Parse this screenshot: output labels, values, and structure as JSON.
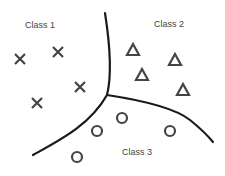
{
  "diagram": {
    "labels": [
      {
        "text": "Class 1",
        "x": 25,
        "y": 20
      },
      {
        "text": "Class 2",
        "x": 154,
        "y": 19
      },
      {
        "text": "Class 3",
        "x": 122,
        "y": 147
      }
    ],
    "classes": [
      {
        "name": "Class 1",
        "marker": "cross",
        "points": [
          [
            20,
            59
          ],
          [
            58,
            52
          ],
          [
            80,
            87
          ],
          [
            37,
            103
          ]
        ]
      },
      {
        "name": "Class 2",
        "marker": "triangle",
        "points": [
          [
            133,
            50
          ],
          [
            175,
            60
          ],
          [
            142,
            75
          ],
          [
            183,
            90
          ]
        ]
      },
      {
        "name": "Class 3",
        "marker": "circle",
        "points": [
          [
            97,
            131
          ],
          [
            122,
            118
          ],
          [
            170,
            131
          ],
          [
            77,
            157
          ]
        ]
      }
    ],
    "boundaries": [
      {
        "name": "boundary-1-2",
        "path": "M105,13 C110,45 112,75 107,95"
      },
      {
        "name": "boundary-1-3",
        "path": "M107,95 C90,125 60,140 33,155"
      },
      {
        "name": "boundary-2-3",
        "path": "M107,95 C140,100 175,108 190,120 C200,128 208,136 213,142"
      }
    ],
    "colors": {
      "line": "#1a1a1a",
      "marker": "#444444",
      "label": "#444444"
    }
  }
}
